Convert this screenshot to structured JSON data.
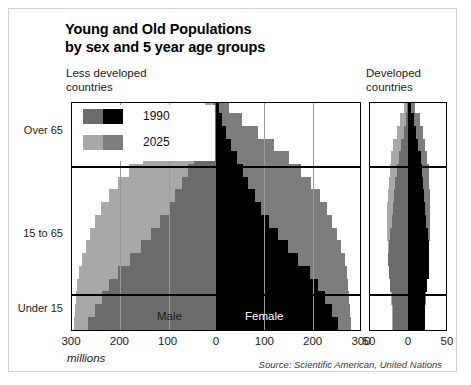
{
  "panels": {
    "left_heading": "Less developed\ncountries",
    "right_heading": "Developed\ncountries"
  },
  "legend": {
    "items": [
      {
        "label": "1990",
        "male_color": "#6b6b6b",
        "female_color": "#000000"
      },
      {
        "label": "2025",
        "male_color": "#a8a8a8",
        "female_color": "#7d7d7d"
      }
    ]
  },
  "axis": {
    "y_labels": [
      "Over 65",
      "15 to 65",
      "Under 15"
    ],
    "x_labels_left_panel": [
      "300",
      "200",
      "100",
      "0",
      "100",
      "200",
      "300"
    ],
    "x_labels_right_panel": [
      "50",
      "0",
      "50"
    ],
    "units": "millions"
  },
  "inbar_labels": {
    "male": "Male",
    "female": "Female"
  },
  "source": "Source: Scientific American, United Nations",
  "colors": {
    "m1990": "#6b6b6b",
    "f1990": "#000000",
    "m2025": "#a8a8a8",
    "f2025": "#7d7d7d",
    "frame": "#d2d2d2",
    "grid": "#9a9a9a",
    "axis": "#000000"
  },
  "chart_data": {
    "type": "bar",
    "subtitle": "Less developed countries / Developed countries",
    "orientation": "horizontal-population-pyramid",
    "xlabel": "millions",
    "ylabel": "age group",
    "xlim_left_panel": [
      -300,
      300
    ],
    "xlim_right_panel": [
      -50,
      50
    ],
    "grid": true,
    "legend_position": "upper-left-inside",
    "age_bands": [
      "Under 15",
      "15 to 65",
      "Over 65"
    ],
    "age_groups": [
      "0-4",
      "5-9",
      "10-14",
      "15-19",
      "20-24",
      "25-29",
      "30-34",
      "35-39",
      "40-44",
      "45-49",
      "50-54",
      "55-59",
      "60-64",
      "65-69",
      "70-74",
      "75-79",
      "80-84",
      "85+"
    ],
    "series": [
      {
        "name": "1990 Male (less developed)",
        "color": "#6b6b6b",
        "panel": "less_developed",
        "side": "left",
        "values": [
          265,
          250,
          236,
          222,
          203,
          178,
          156,
          135,
          115,
          98,
          84,
          70,
          58,
          45,
          33,
          21,
          11,
          5
        ]
      },
      {
        "name": "1990 Female (less developed)",
        "color": "#000000",
        "panel": "less_developed",
        "side": "right",
        "values": [
          253,
          239,
          226,
          212,
          194,
          170,
          149,
          129,
          110,
          94,
          80,
          67,
          55,
          43,
          32,
          21,
          12,
          6
        ]
      },
      {
        "name": "2025 Male (less developed)",
        "color": "#a8a8a8",
        "panel": "less_developed",
        "side": "left",
        "values": [
          293,
          291,
          289,
          287,
          283,
          277,
          270,
          261,
          250,
          237,
          222,
          203,
          180,
          152,
          120,
          85,
          50,
          22
        ]
      },
      {
        "name": "2025 Female (less developed)",
        "color": "#7d7d7d",
        "panel": "less_developed",
        "side": "right",
        "values": [
          280,
          278,
          276,
          274,
          271,
          266,
          259,
          251,
          241,
          229,
          215,
          197,
          176,
          150,
          120,
          87,
          54,
          26
        ]
      },
      {
        "name": "1990 Male (developed)",
        "color": "#6b6b6b",
        "panel": "developed",
        "side": "left",
        "values": [
          21,
          21,
          22,
          24,
          26,
          27,
          26,
          24,
          22,
          20,
          19,
          18,
          16,
          13,
          10,
          7,
          4,
          2
        ]
      },
      {
        "name": "1990 Female (developed)",
        "color": "#000000",
        "panel": "developed",
        "side": "right",
        "values": [
          20,
          20,
          21,
          23,
          25,
          26,
          25,
          24,
          22,
          20,
          19,
          18,
          17,
          15,
          12,
          9,
          6,
          3
        ]
      },
      {
        "name": "2025 Male (developed)",
        "color": "#a8a8a8",
        "panel": "developed",
        "side": "left",
        "values": [
          22,
          22,
          23,
          24,
          25,
          26,
          27,
          28,
          28,
          28,
          27,
          26,
          25,
          23,
          20,
          16,
          11,
          6
        ]
      },
      {
        "name": "2025 Female (developed)",
        "color": "#7d7d7d",
        "panel": "developed",
        "side": "right",
        "values": [
          21,
          21,
          22,
          23,
          24,
          25,
          26,
          27,
          27,
          27,
          27,
          26,
          25,
          23,
          21,
          18,
          14,
          8
        ]
      }
    ]
  }
}
